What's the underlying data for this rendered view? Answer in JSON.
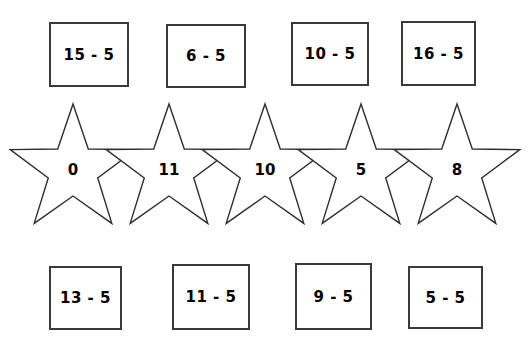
{
  "worksheet": {
    "title": "Subtract 5 matching worksheet",
    "background_color": "#ffffff",
    "ink_color": "#2e2e2e",
    "width": 527,
    "height": 339
  },
  "top_row": {
    "name": "top-expression-row",
    "cards": [
      {
        "label": "15 - 5",
        "x": 49,
        "y": 22,
        "w": 80,
        "h": 65
      },
      {
        "label": "6 - 5",
        "x": 166,
        "y": 24,
        "w": 80,
        "h": 64
      },
      {
        "label": "10 - 5",
        "x": 291,
        "y": 22,
        "w": 78,
        "h": 64
      },
      {
        "label": "16 - 5",
        "x": 401,
        "y": 21,
        "w": 75,
        "h": 65
      }
    ]
  },
  "star_row": {
    "name": "star-answer-row",
    "stars": [
      {
        "value": "0",
        "cx": 73,
        "cy": 170
      },
      {
        "value": "11",
        "cx": 169,
        "cy": 170
      },
      {
        "value": "10",
        "cx": 265,
        "cy": 170
      },
      {
        "value": "5",
        "cx": 361,
        "cy": 170
      },
      {
        "value": "8",
        "cx": 457,
        "cy": 170
      }
    ],
    "star_outer_radius": 66,
    "star_inner_radius": 26,
    "star_top_y": 104,
    "star_bottom_y": 226
  },
  "bottom_row": {
    "name": "bottom-expression-row",
    "cards": [
      {
        "label": "13 - 5",
        "x": 49,
        "y": 266,
        "w": 73,
        "h": 64
      },
      {
        "label": "11 - 5",
        "x": 172,
        "y": 264,
        "w": 78,
        "h": 66
      },
      {
        "label": "9 - 5",
        "x": 295,
        "y": 263,
        "w": 77,
        "h": 67
      },
      {
        "label": "5 - 5",
        "x": 408,
        "y": 266,
        "w": 75,
        "h": 63
      }
    ]
  }
}
